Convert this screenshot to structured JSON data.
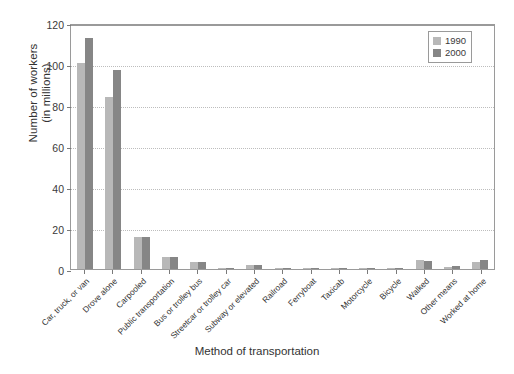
{
  "chart_data": {
    "type": "bar",
    "title": "",
    "xlabel": "Method of transportation",
    "ylabel": "Number of workers (in millions)",
    "ylabel_line1": "Number of workers",
    "ylabel_line2": "(in millions)",
    "ylim": [
      0,
      120
    ],
    "yticks": [
      0,
      20,
      40,
      60,
      80,
      100,
      120
    ],
    "grid": true,
    "legend_position": "top-right",
    "categories": [
      "Car, truck, or van",
      "Drove alone",
      "Carpooled",
      "Public transportation",
      "Bus or trolley bus",
      "Streetcar or trolley car",
      "Subway or elevated",
      "Railroad",
      "Ferryboat",
      "Taxicab",
      "Motorcycle",
      "Bicycle",
      "Walked",
      "Other means",
      "Worked at home"
    ],
    "series": [
      {
        "name": "1990",
        "color": "#b8b8b8",
        "values": [
          100.5,
          84.0,
          15.4,
          6.1,
          3.4,
          0.1,
          1.8,
          0.5,
          0.04,
          0.2,
          0.2,
          0.5,
          4.5,
          0.8,
          3.4
        ]
      },
      {
        "name": "2000",
        "color": "#868686",
        "values": [
          112.7,
          97.1,
          15.6,
          6.1,
          3.2,
          0.07,
          1.9,
          0.5,
          0.03,
          0.2,
          0.1,
          0.5,
          3.8,
          1.5,
          4.2
        ]
      }
    ]
  },
  "legend": {
    "items": [
      {
        "label": "1990",
        "color": "#b8b8b8"
      },
      {
        "label": "2000",
        "color": "#868686"
      }
    ]
  }
}
